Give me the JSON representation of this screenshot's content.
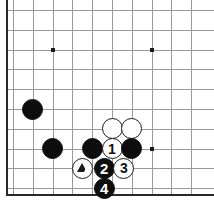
{
  "diagram": {
    "kind": "go-board-diagram",
    "board_size_shown": {
      "cols": 10,
      "rows": 10
    },
    "edges_shown": [
      "left",
      "bottom"
    ],
    "colors": {
      "background": "#ffffff",
      "grid": "#9a9a9a",
      "edge": "#2a2a2a",
      "black_stone": "#0d0d0d",
      "white_stone": "#ffffff",
      "stone_outline": "#1a1a1a"
    },
    "geometry": {
      "origin_x": 13,
      "origin_y": 10,
      "spacing": 19.8,
      "stone_diameter": 21
    },
    "star_points": [
      {
        "name": "star-point-upper-left",
        "col": 2,
        "row": 2
      },
      {
        "name": "star-point-upper-right",
        "col": 7,
        "row": 2
      },
      {
        "name": "star-point-lower-right",
        "col": 7,
        "row": 7
      }
    ],
    "stones": [
      {
        "id": "black-stone-a",
        "color": "black",
        "col": 1,
        "row": 5,
        "label": "",
        "mark": ""
      },
      {
        "id": "black-stone-b",
        "color": "black",
        "col": 2,
        "row": 7,
        "label": "",
        "mark": ""
      },
      {
        "id": "white-stone-c",
        "color": "white",
        "col": 5,
        "row": 6,
        "label": "",
        "mark": ""
      },
      {
        "id": "white-stone-d",
        "color": "white",
        "col": 6,
        "row": 6,
        "label": "",
        "mark": ""
      },
      {
        "id": "black-stone-e",
        "color": "black",
        "col": 4,
        "row": 7,
        "label": "",
        "mark": ""
      },
      {
        "id": "white-move-1",
        "color": "white",
        "col": 5,
        "row": 7,
        "label": "1",
        "mark": ""
      },
      {
        "id": "black-stone-f",
        "color": "black",
        "col": 6,
        "row": 7,
        "label": "",
        "mark": ""
      },
      {
        "id": "white-stone-triangle",
        "color": "white",
        "col": 3.5,
        "row": 8,
        "label": "",
        "mark": "triangle"
      },
      {
        "id": "black-move-2",
        "color": "black",
        "col": 4.6,
        "row": 8,
        "label": "2",
        "mark": ""
      },
      {
        "id": "white-move-3",
        "color": "white",
        "col": 5.6,
        "row": 8,
        "label": "3",
        "mark": ""
      },
      {
        "id": "black-move-4",
        "color": "black",
        "col": 4.6,
        "row": 9,
        "label": "4",
        "mark": ""
      }
    ],
    "move_sequence": [
      {
        "number": "1",
        "color": "white"
      },
      {
        "number": "2",
        "color": "black"
      },
      {
        "number": "3",
        "color": "white"
      },
      {
        "number": "4",
        "color": "black"
      }
    ],
    "marks": [
      {
        "symbol": "triangle",
        "on": "white-stone-triangle"
      }
    ]
  }
}
